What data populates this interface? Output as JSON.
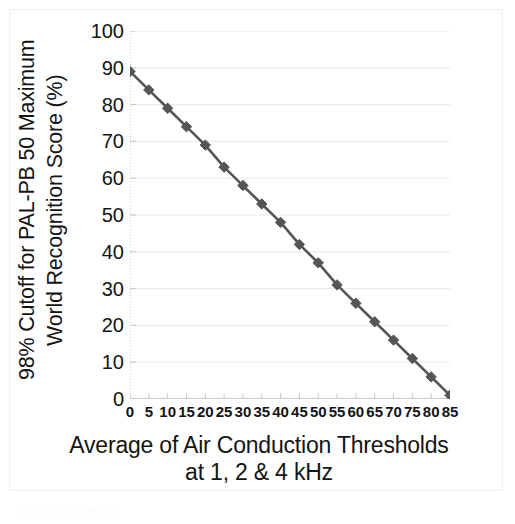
{
  "figure": {
    "ghost_caption": "Fig. 2  Relationship"
  },
  "chart_data": {
    "type": "line",
    "title": "",
    "xlabel_line1": "Average of Air Conduction Thresholds",
    "xlabel_line2": "at 1, 2 & 4 kHz",
    "ylabel_line1": "98% Cutoff for PAL-PB 50 Maximum",
    "ylabel_line2": "World Recognition Score (%)",
    "xlim": [
      0,
      85
    ],
    "ylim": [
      0,
      100
    ],
    "xticks": [
      0,
      5,
      10,
      15,
      20,
      25,
      30,
      35,
      40,
      45,
      50,
      55,
      60,
      65,
      70,
      75,
      80,
      85
    ],
    "yticks": [
      0,
      10,
      20,
      30,
      40,
      50,
      60,
      70,
      80,
      90,
      100
    ],
    "grid": true,
    "legend": "none",
    "series": [
      {
        "name": "98% cutoff",
        "marker": "diamond",
        "color": "#555555",
        "line_color": "#555555",
        "x": [
          0,
          5,
          10,
          15,
          20,
          25,
          30,
          35,
          40,
          45,
          50,
          55,
          60,
          65,
          70,
          75,
          80,
          85
        ],
        "values": [
          89,
          84,
          79,
          74,
          69,
          63,
          58,
          53,
          48,
          42,
          37,
          31,
          26,
          21,
          16,
          11,
          6,
          1
        ]
      }
    ]
  },
  "colors": {
    "series": "#555555",
    "grid": "#e9e9ea",
    "axis": "#c9c9cb",
    "text": "#141414",
    "frame": "#eceef0",
    "background": "#ffffff"
  }
}
